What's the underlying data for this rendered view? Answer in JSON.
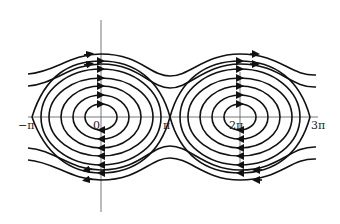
{
  "diagram": {
    "type": "phase-portrait",
    "axes": {
      "x_ticks": [
        {
          "label": "−π",
          "x": 32
        },
        {
          "label": "0",
          "x": 101
        },
        {
          "label": "π",
          "x": 170
        },
        {
          "label": "2π",
          "x": 240
        },
        {
          "label": "3π",
          "x": 310
        }
      ]
    },
    "centers": [
      {
        "x": 101,
        "y": 117
      },
      {
        "x": 240,
        "y": 117
      }
    ],
    "orbit_radii": [
      [
        16,
        13
      ],
      [
        28,
        22
      ],
      [
        40,
        31
      ],
      [
        52,
        39
      ],
      [
        60,
        48
      ]
    ],
    "separatrix_half_height": 56,
    "stroke_color": "#111111"
  }
}
